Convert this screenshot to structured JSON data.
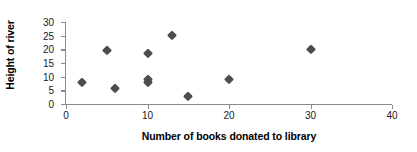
{
  "chart_data": {
    "type": "scatter",
    "title": "",
    "xlabel": "Number of books donated to library",
    "ylabel": "Height of river",
    "xlim": [
      0,
      40
    ],
    "ylim": [
      0,
      30
    ],
    "xticks": [
      0,
      10,
      20,
      30,
      40
    ],
    "yticks": [
      0,
      5,
      10,
      15,
      20,
      25,
      30
    ],
    "xtick_labels": [
      "0",
      "10",
      "20",
      "30",
      "40"
    ],
    "ytick_labels": [
      "0",
      "5",
      "10",
      "15",
      "20",
      "25",
      "30"
    ],
    "grid": false,
    "legend": false,
    "marker": "diamond",
    "marker_color": "#4d4d4d",
    "axis_color": "#8a8a8a",
    "points": [
      {
        "x": 2,
        "y": 8.0
      },
      {
        "x": 5,
        "y": 19.7
      },
      {
        "x": 6,
        "y": 6.0
      },
      {
        "x": 10,
        "y": 18.5
      },
      {
        "x": 10,
        "y": 9.0
      },
      {
        "x": 10,
        "y": 8.2
      },
      {
        "x": 13,
        "y": 25.2
      },
      {
        "x": 15,
        "y": 3.0
      },
      {
        "x": 20,
        "y": 9.0
      },
      {
        "x": 30,
        "y": 20.3
      }
    ]
  }
}
